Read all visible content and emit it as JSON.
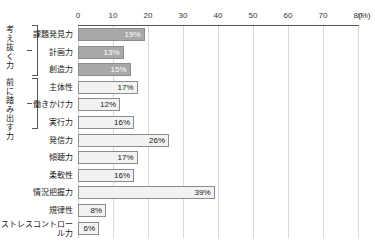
{
  "chart_data": {
    "type": "bar",
    "orientation": "horizontal",
    "title": "",
    "xlabel": "(%)",
    "ylabel": "",
    "xlim": [
      0,
      80
    ],
    "xticks": [
      0,
      10,
      20,
      30,
      40,
      50,
      60,
      70,
      80
    ],
    "grid": true,
    "legend": null,
    "categories": [
      "課題発見力",
      "計画力",
      "創造力",
      "主体性",
      "働きかけ力",
      "実行力",
      "発信力",
      "傾聴力",
      "柔軟性",
      "情況把握力",
      "規律性",
      "ストレスコント\nロール力"
    ],
    "values": [
      19,
      13,
      15,
      17,
      12,
      16,
      26,
      17,
      16,
      39,
      8,
      6
    ],
    "value_labels": [
      "19%",
      "13%",
      "15%",
      "17%",
      "12%",
      "16%",
      "26%",
      "17%",
      "16%",
      "39%",
      "8%",
      "6%"
    ],
    "bar_styles": [
      "dark",
      "dark",
      "dark",
      "light",
      "light",
      "light",
      "light",
      "light",
      "light",
      "light",
      "light",
      "light"
    ],
    "groups": [
      {
        "name": "考え抜く力",
        "start": 0,
        "end": 2
      },
      {
        "name": "前に踏み出す力",
        "start": 3,
        "end": 5
      }
    ],
    "colors": {
      "bar_dark": "#a8a8a8",
      "bar_light": "#f2f2f2",
      "bar_border": "#8c8c8c",
      "axis": "#555555",
      "grid": "#d8d8d8",
      "text": "#1a1a1a",
      "dark_bar_text": "#ffffff"
    }
  },
  "axis": {
    "unit_label": "(%)",
    "tick_labels": [
      "0",
      "10",
      "20",
      "30",
      "40",
      "50",
      "60",
      "70",
      "80"
    ]
  },
  "rows": [
    {
      "label": "課題発見力",
      "value_label": "19%"
    },
    {
      "label": "計画力",
      "value_label": "13%"
    },
    {
      "label": "創造力",
      "value_label": "15%"
    },
    {
      "label": "主体性",
      "value_label": "17%"
    },
    {
      "label": "働きかけ力",
      "value_label": "12%"
    },
    {
      "label": "実行力",
      "value_label": "16%"
    },
    {
      "label": "発信力",
      "value_label": "26%"
    },
    {
      "label": "傾聴力",
      "value_label": "17%"
    },
    {
      "label": "柔軟性",
      "value_label": "16%"
    },
    {
      "label": "情況把握力",
      "value_label": "39%"
    },
    {
      "label": "規律性",
      "value_label": "8%"
    },
    {
      "label": "ストレスコントロール力",
      "value_label": "6%"
    }
  ],
  "groups": [
    {
      "name": "考え抜く力"
    },
    {
      "name": "前に踏み出す力"
    }
  ]
}
